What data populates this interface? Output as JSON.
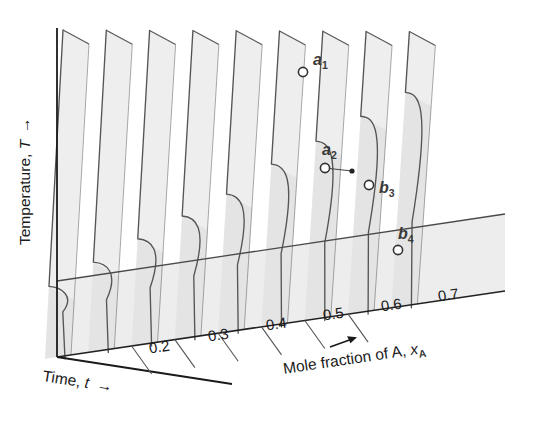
{
  "figure": {
    "kind": "three-dimensional cooling-curve diagram",
    "axes": {
      "y_label_text": "Temperature, ",
      "y_label_var": "T",
      "y_label_arrow": "→",
      "depth_label_text": "Time, ",
      "depth_label_var": "t",
      "depth_label_arrow": "→",
      "x_label_text": "Mole fraction of A, ",
      "x_label_var": "x",
      "x_label_sub": "A",
      "x_label_arrow": "→"
    },
    "x_ticks": [
      {
        "label": "0.2",
        "value": 0.2,
        "x": 160,
        "y": 352
      },
      {
        "label": "0.3",
        "value": 0.3,
        "x": 219,
        "y": 340
      },
      {
        "label": "0.4",
        "value": 0.4,
        "x": 277,
        "y": 329
      },
      {
        "label": "0.5",
        "value": 0.5,
        "x": 334,
        "y": 319
      },
      {
        "label": "0.6",
        "value": 0.6,
        "x": 392,
        "y": 310
      },
      {
        "label": "0.7",
        "value": 0.7,
        "x": 449,
        "y": 300
      }
    ],
    "points": [
      {
        "id": "a1",
        "letter": "a",
        "sub": "1",
        "style": "open",
        "cx": 303,
        "cy": 72,
        "lx": 313,
        "ly": 65
      },
      {
        "id": "a2",
        "letter": "a",
        "sub": "2",
        "style": "open",
        "cx": 325,
        "cy": 168,
        "lx": 322,
        "ly": 155
      },
      {
        "id": "dot",
        "letter": "",
        "sub": "",
        "style": "filled",
        "cx": 352,
        "cy": 171,
        "lx": 0,
        "ly": 0
      },
      {
        "id": "b3",
        "letter": "b",
        "sub": "3",
        "style": "open",
        "cx": 369,
        "cy": 185,
        "lx": 379,
        "ly": 193
      },
      {
        "id": "b4",
        "letter": "b",
        "sub": "4",
        "style": "open",
        "cx": 398,
        "cy": 250,
        "lx": 398,
        "ly": 239
      }
    ]
  },
  "chart_data": {
    "type": "line",
    "title": "",
    "xlabel": "Mole fraction of A, xA",
    "ylabel": "Temperature, T",
    "zlabel": "Time, t",
    "grid": false,
    "legend": "none",
    "categories": [
      "0.2",
      "0.3",
      "0.4",
      "0.5",
      "0.6",
      "0.7"
    ],
    "series": [
      {
        "name": "cooling curve 1",
        "mole_fraction": 0.05,
        "break_temp_frac": 0.22,
        "eutectic_halt_frac": 0.1
      },
      {
        "name": "cooling curve 2",
        "mole_fraction": 0.15,
        "break_temp_frac": 0.28,
        "eutectic_halt_frac": 0.12
      },
      {
        "name": "cooling curve 3",
        "mole_fraction": 0.25,
        "break_temp_frac": 0.34,
        "eutectic_halt_frac": 0.14
      },
      {
        "name": "cooling curve 4",
        "mole_fraction": 0.35,
        "break_temp_frac": 0.4,
        "eutectic_halt_frac": 0.16
      },
      {
        "name": "cooling curve 5",
        "mole_fraction": 0.45,
        "break_temp_frac": 0.46,
        "eutectic_halt_frac": 0.18
      },
      {
        "name": "cooling curve 6",
        "mole_fraction": 0.55,
        "break_temp_frac": 0.55,
        "eutectic_halt_frac": 0.2
      },
      {
        "name": "cooling curve 7",
        "mole_fraction": 0.65,
        "break_temp_frac": 0.62,
        "eutectic_halt_frac": 0.22
      },
      {
        "name": "cooling curve 8",
        "mole_fraction": 0.75,
        "break_temp_frac": 0.7,
        "eutectic_halt_frac": 0.24
      },
      {
        "name": "cooling curve 9",
        "mole_fraction": 0.85,
        "break_temp_frac": 0.78,
        "eutectic_halt_frac": 0.26
      }
    ],
    "annotations": [
      "a1",
      "a2",
      "b3",
      "b4"
    ]
  },
  "colors": {
    "plate_fill": "#ededed",
    "plate_fill_dark": "#dcdcdc",
    "floor_fill": "#e4e4e4",
    "line": "#555555",
    "axis_line": "#1a1a1a",
    "text": "#1a1a1a",
    "point_stroke": "#333333",
    "point_fill": "#ffffff",
    "background": "#ffffff"
  }
}
